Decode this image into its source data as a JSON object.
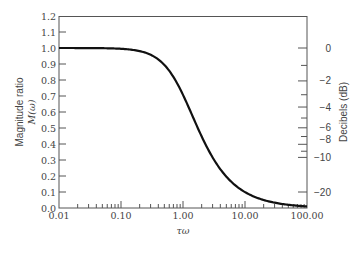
{
  "chart_data": {
    "type": "line",
    "title": "",
    "xlabel": "τω",
    "ylabel": "Magnitude ratio M(ω)",
    "ylabel_line1": "Magnitude ratio",
    "ylabel_line2": "M(ω)",
    "y2label": "Decibels (dB)",
    "xscale": "log",
    "xlim": [
      0.01,
      100.0
    ],
    "ylim": [
      0.0,
      1.2
    ],
    "grid": false,
    "legend": null,
    "x_tick_labels": [
      "0.01",
      "0.10",
      "1.00",
      "10.00",
      "100.00"
    ],
    "x_tick_values": [
      0.01,
      0.1,
      1.0,
      10.0,
      100.0
    ],
    "y_tick_labels": [
      "0.0",
      "0.1",
      "0.2",
      "0.3",
      "0.4",
      "0.5",
      "0.6",
      "0.7",
      "0.8",
      "0.9",
      "1.0",
      "1.1",
      "1.2"
    ],
    "y_tick_values": [
      0.0,
      0.1,
      0.2,
      0.3,
      0.4,
      0.5,
      0.6,
      0.7,
      0.8,
      0.9,
      1.0,
      1.1,
      1.2
    ],
    "y2_tick_labels": [
      "0",
      "−2",
      "−4",
      "−6",
      "−8",
      "−10",
      "−20"
    ],
    "y2_tick_values_db": [
      0,
      -2,
      -4,
      -6,
      -8,
      -10,
      -20
    ],
    "y2_minor_ticks_db": [
      -1,
      -3,
      -5,
      -7,
      -9
    ],
    "series": [
      {
        "name": "M(ω) = 1/√(1+(τω)²)",
        "x": [
          0.01,
          0.02,
          0.05,
          0.1,
          0.2,
          0.3,
          0.5,
          0.7,
          1.0,
          1.5,
          2.0,
          3.0,
          5.0,
          7.0,
          10.0,
          20.0,
          50.0,
          100.0
        ],
        "values": [
          1.0,
          1.0,
          0.999,
          0.995,
          0.981,
          0.958,
          0.894,
          0.819,
          0.707,
          0.555,
          0.447,
          0.316,
          0.196,
          0.141,
          0.0995,
          0.05,
          0.02,
          0.01
        ]
      }
    ]
  }
}
